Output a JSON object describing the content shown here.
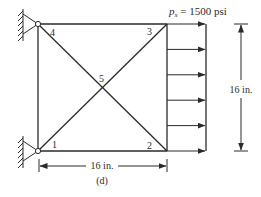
{
  "figure": {
    "caption": "(d)",
    "load_label_symbol": "p",
    "load_label_subscript": "x",
    "load_label_value": " = 1500 psi",
    "width_dimension": "16 in.",
    "height_dimension": "16 in.",
    "nodes": [
      {
        "id": "1",
        "label": "1"
      },
      {
        "id": "2",
        "label": "2"
      },
      {
        "id": "3",
        "label": "3"
      },
      {
        "id": "4",
        "label": "4"
      },
      {
        "id": "5",
        "label": "5"
      }
    ],
    "supports": [
      "node-4-pin-support",
      "node-1-pin-support"
    ],
    "load_arrow_count": 6,
    "colors": {
      "ink": "#2a2a2a",
      "background": "#ffffff"
    }
  }
}
